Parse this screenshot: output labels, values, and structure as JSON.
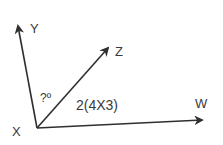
{
  "diagram": {
    "type": "angle-diagram",
    "vertex": {
      "label": "X",
      "x": 37,
      "y": 128
    },
    "rays": [
      {
        "label": "Y",
        "tip": {
          "x": 18,
          "y": 24
        }
      },
      {
        "label": "Z",
        "tip": {
          "x": 110,
          "y": 46
        }
      },
      {
        "label": "W",
        "tip": {
          "x": 204,
          "y": 120
        }
      }
    ],
    "angle_labels": {
      "unknown_angle": "?º",
      "known_angle": "2(4X3)"
    },
    "colors": {
      "line": "#2f2f2f",
      "text": "#3a3a3a",
      "background": "#ffffff"
    }
  }
}
